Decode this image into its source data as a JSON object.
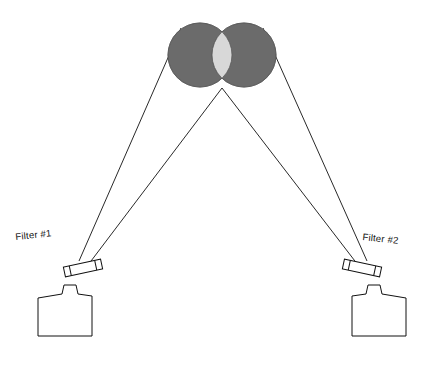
{
  "figure": {
    "title": "",
    "background_color": "#ffffff",
    "line_color": "#111111",
    "disc_fill_color": "#6b6b6b",
    "overlap_fill_color": "#d8d8d8",
    "outline_color": "#000000"
  },
  "labels": {
    "filter_1": "Filter #1",
    "filter_2": "Filter #2"
  },
  "objects": {
    "left_disc": {
      "name": "left-disc",
      "cx": 200,
      "cy": 55,
      "r": 32,
      "fill": "#6b6b6b"
    },
    "right_disc": {
      "name": "right-disc",
      "cx": 244,
      "cy": 55,
      "r": 32,
      "fill": "#6b6b6b"
    },
    "overlap_region": {
      "name": "disc-overlap-region",
      "fill": "#d8d8d8"
    },
    "filter_1_plate": {
      "name": "filter-1-plate",
      "cx": 83,
      "cy": 268,
      "width": 38,
      "height": 10,
      "rotation_deg": -10
    },
    "filter_2_plate": {
      "name": "filter-2-plate",
      "cx": 362,
      "cy": 268,
      "width": 38,
      "height": 10,
      "rotation_deg": 10
    },
    "camera_1": {
      "name": "camera-1-body",
      "x": 36,
      "y": 286,
      "width": 56,
      "height": 48
    },
    "camera_2": {
      "name": "camera-2-body",
      "x": 352,
      "y": 286,
      "width": 56,
      "height": 48
    }
  },
  "rays": {
    "camera_1_rays": [
      {
        "from_x": 78,
        "from_y": 262,
        "to_x": 178,
        "to_y": 30
      },
      {
        "from_x": 86,
        "from_y": 266,
        "to_x": 222,
        "to_y": 88
      }
    ],
    "camera_2_rays": [
      {
        "from_x": 368,
        "from_y": 262,
        "to_x": 266,
        "to_y": 30
      },
      {
        "from_x": 360,
        "from_y": 266,
        "to_x": 222,
        "to_y": 88
      }
    ]
  }
}
